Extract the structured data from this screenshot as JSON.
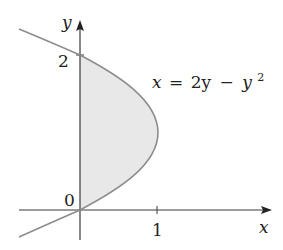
{
  "diagram": {
    "type": "region-between-curve-and-axis",
    "equation": {
      "lhs": "x",
      "eq": "=",
      "rhs_a": "2y",
      "minus": "−",
      "rhs_b": "y",
      "exponent": "2",
      "full": "x = 2y − y^2"
    },
    "axes": {
      "x_label": "x",
      "y_label": "y",
      "origin_label": "0",
      "x_tick_label": "1",
      "y_tick_label": "2"
    },
    "region": {
      "description": "Shaded region bounded by the y-axis and the parabola x = 2y − y² for 0 ≤ y ≤ 2"
    },
    "colors": {
      "curve": "#8c8c8c",
      "fill": "#e8e8e8",
      "axis": "#3a3a3a",
      "text": "#222222"
    }
  }
}
